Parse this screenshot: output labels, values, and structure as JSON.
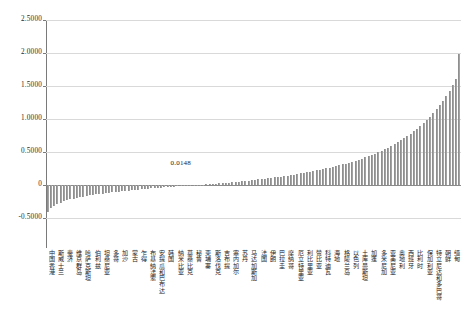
{
  "chart_data": {
    "type": "bar",
    "title": "",
    "subtitle": "",
    "xlabel": "",
    "ylabel": "",
    "ylim": [
      -0.75,
      2.5
    ],
    "grid": true,
    "legend": null,
    "orientation": "vertical",
    "sorted": "ascending",
    "annotations": [
      {
        "text": "0.0148",
        "x_index": 41,
        "y_value": 0.0148
      }
    ],
    "y_ticks": [
      {
        "value": 2.5,
        "label": "2.5000"
      },
      {
        "value": 2.0,
        "label": "2.0000"
      },
      {
        "value": 1.5,
        "label": "1.5000"
      },
      {
        "value": 1.0,
        "label": "1.0000"
      },
      {
        "value": 0.5,
        "label": "0.5000"
      },
      {
        "value": 0.0,
        "label": "0"
      },
      {
        "value": -0.5,
        "label": "-0.5000"
      }
    ],
    "categories": [
      "中国香港",
      "斯威士兰",
      "斐济",
      "维京群岛",
      "哈萨克斯坦",
      "伯利兹",
      "坦桑尼亚",
      "多哥",
      "加沙",
      "蒙古",
      "乍得",
      "布基纳法索",
      "安提瓜和巴布达",
      "韩国",
      "纳米比亚",
      "莫桑比克",
      "秘鲁",
      "柬埔寨",
      "斯洛伐克",
      "吉布提",
      "塞内加尔",
      "苏丹",
      "马达加斯加",
      "法国",
      "伊朗",
      "巴拉圭",
      "摩纳哥",
      "厄立特里亚",
      "利比里亚",
      "赞比亚",
      "科特迪瓦",
      "海地",
      "格陵兰岛",
      "以色列",
      "土库曼斯坦",
      "加蓬",
      "多米尼加",
      "亚美尼亚",
      "奥地利",
      "西班牙",
      "比利时",
      "保加利亚",
      "特立尼达和多巴哥",
      "朝鲜",
      "缅甸"
    ],
    "values": [
      -0.418,
      -0.362,
      -0.324,
      -0.296,
      -0.274,
      -0.256,
      -0.24,
      -0.226,
      -0.214,
      -0.202,
      -0.192,
      -0.182,
      -0.173,
      -0.165,
      -0.157,
      -0.15,
      -0.143,
      -0.136,
      -0.13,
      -0.124,
      -0.118,
      -0.112,
      -0.107,
      -0.101,
      -0.096,
      -0.091,
      -0.086,
      -0.081,
      -0.077,
      -0.072,
      -0.068,
      -0.063,
      -0.059,
      -0.055,
      -0.051,
      -0.047,
      -0.043,
      -0.039,
      -0.035,
      -0.031,
      -0.027,
      -0.024,
      -0.02,
      -0.016,
      -0.013
    ],
    "full_series_note": "Ascending sorted series of 130 bars spanning -0.4180 to 1.9900; the labeled axis ticks below correspond to every third bar.",
    "all_values": [
      -0.418,
      -0.362,
      -0.324,
      -0.296,
      -0.274,
      -0.256,
      -0.24,
      -0.226,
      -0.214,
      -0.202,
      -0.192,
      -0.182,
      -0.173,
      -0.165,
      -0.157,
      -0.15,
      -0.143,
      -0.136,
      -0.13,
      -0.124,
      -0.118,
      -0.112,
      -0.107,
      -0.101,
      -0.096,
      -0.091,
      -0.086,
      -0.081,
      -0.077,
      -0.072,
      -0.068,
      -0.063,
      -0.059,
      -0.055,
      -0.051,
      -0.047,
      -0.043,
      -0.039,
      -0.035,
      -0.031,
      -0.027,
      -0.024,
      -0.02,
      -0.016,
      -0.013,
      -0.009,
      -0.006,
      -0.002,
      0.001,
      0.005,
      0.009,
      0.013,
      0.0148,
      0.019,
      0.023,
      0.027,
      0.032,
      0.036,
      0.041,
      0.046,
      0.051,
      0.056,
      0.061,
      0.067,
      0.072,
      0.078,
      0.084,
      0.09,
      0.096,
      0.103,
      0.109,
      0.116,
      0.123,
      0.13,
      0.138,
      0.145,
      0.153,
      0.161,
      0.169,
      0.178,
      0.187,
      0.196,
      0.205,
      0.215,
      0.225,
      0.235,
      0.246,
      0.257,
      0.269,
      0.281,
      0.293,
      0.306,
      0.32,
      0.334,
      0.348,
      0.364,
      0.38,
      0.396,
      0.414,
      0.432,
      0.451,
      0.471,
      0.492,
      0.514,
      0.537,
      0.561,
      0.586,
      0.613,
      0.641,
      0.671,
      0.702,
      0.735,
      0.77,
      0.807,
      0.846,
      0.888,
      0.932,
      0.979,
      1.029,
      1.083,
      1.141,
      1.203,
      1.27,
      1.343,
      1.422,
      1.508,
      1.602,
      1.99
    ]
  }
}
